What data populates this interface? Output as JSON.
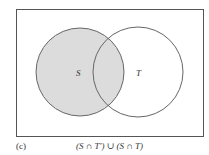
{
  "diagram": {
    "type": "venn",
    "sets": [
      {
        "name": "S",
        "shaded": true
      },
      {
        "name": "T",
        "shaded": false
      }
    ],
    "shaded_region": "S",
    "colors": {
      "shade": "#dcdcdc",
      "stroke": "#555555",
      "background": "#ffffff"
    }
  },
  "labels": {
    "set_s": "S",
    "set_t": "T",
    "panel": "(c)",
    "formula": "(S ∩ T′) ∪ (S ∩ T)"
  }
}
